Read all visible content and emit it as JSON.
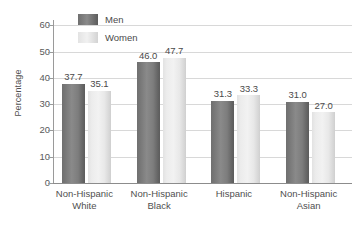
{
  "chart_data": {
    "type": "bar",
    "title": "",
    "xlabel": "",
    "ylabel": "Percentage",
    "ylim": [
      0,
      62
    ],
    "yticks": [
      0,
      10,
      20,
      30,
      40,
      50,
      60
    ],
    "ytick_labels": [
      "0",
      "10",
      "20",
      "30",
      "40",
      "50",
      "60"
    ],
    "grid": "horizontal",
    "legend_position": "top-left-inside",
    "categories": [
      "Non-Hispanic White",
      "Non-Hispanic Black",
      "Hispanic",
      "Non-Hispanic Asian"
    ],
    "category_lines": [
      [
        "Non-Hispanic",
        "White"
      ],
      [
        "Non-Hispanic",
        "Black"
      ],
      [
        "Hispanic",
        ""
      ],
      [
        "Non-Hispanic",
        "Asian"
      ]
    ],
    "series": [
      {
        "name": "Men",
        "color": "#7d7d7d",
        "values": [
          37.7,
          46.0,
          31.3,
          31.0
        ],
        "labels": [
          "37.7",
          "46.0",
          "31.3",
          "31.0"
        ]
      },
      {
        "name": "Women",
        "color": "#e9e9e9",
        "values": [
          35.1,
          47.7,
          33.3,
          27.0
        ],
        "labels": [
          "35.1",
          "47.7",
          "33.3",
          "27.0"
        ]
      }
    ]
  },
  "legend": {
    "items": [
      {
        "label": "Men",
        "swatch": "men"
      },
      {
        "label": "Women",
        "swatch": "women"
      }
    ]
  },
  "colors": {
    "gridline": "#d8d8d8",
    "axis": "#9a9a9a",
    "baseline": "#8c8c8c",
    "text": "#4a4a4a",
    "background": "#ffffff"
  }
}
